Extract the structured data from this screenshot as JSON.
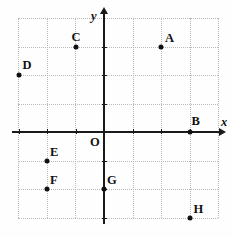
{
  "figure": {
    "type": "coordinate-plane",
    "origin_label": "O",
    "axis_labels": {
      "x": "x",
      "y": "y"
    },
    "grid": {
      "spacing_px": 28.5,
      "x_origin_px": 104,
      "y_origin_px": 132,
      "x_columns_px": [
        18,
        46.5,
        75,
        104,
        132.5,
        161,
        189.5,
        218
      ],
      "y_rows_px": [
        18,
        46.5,
        75,
        103.5,
        132,
        160.5,
        189,
        217.5
      ],
      "x_range_units": [
        -3,
        4
      ],
      "y_range_units": [
        -3,
        4
      ],
      "style": "dotted"
    },
    "colors": {
      "background": "#ffffff",
      "grid": "#b9b9b9",
      "axis": "#1a1a1a",
      "point": "#111111",
      "label": "#111111"
    },
    "x_ticks_units": [
      -3,
      -2,
      -1,
      1,
      2,
      3
    ],
    "y_ticks_units": [
      -3,
      -2,
      -1,
      1,
      2,
      3
    ],
    "points": [
      {
        "label": "A",
        "x": 2,
        "y": 3,
        "label_dx": 4,
        "label_dy": -15
      },
      {
        "label": "B",
        "x": 3,
        "y": 0,
        "label_dx": 2,
        "label_dy": -17
      },
      {
        "label": "C",
        "x": -1,
        "y": 3,
        "label_dx": -4,
        "label_dy": -16
      },
      {
        "label": "D",
        "x": -3,
        "y": 2,
        "label_dx": 4,
        "label_dy": -16
      },
      {
        "label": "E",
        "x": -2,
        "y": -1,
        "label_dx": 3,
        "label_dy": -15
      },
      {
        "label": "F",
        "x": -2,
        "y": -2,
        "label_dx": 3,
        "label_dy": -15
      },
      {
        "label": "G",
        "x": 0,
        "y": -2,
        "label_dx": 3,
        "label_dy": -15
      },
      {
        "label": "H",
        "x": 3,
        "y": -3,
        "label_dx": 4,
        "label_dy": -15
      }
    ]
  }
}
